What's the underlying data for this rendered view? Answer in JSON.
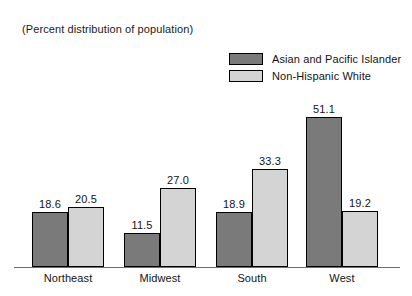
{
  "chart_data": {
    "type": "bar",
    "title": "(Percent distribution of population)",
    "subtitle": "",
    "xlabel": "",
    "ylabel": "",
    "grid": false,
    "legend_position": "top-right",
    "axis": {
      "visible_baseline": true,
      "y_ticks": [],
      "ylim": [
        0,
        55
      ]
    },
    "categories": [
      "Northeast",
      "Midwest",
      "South",
      "West"
    ],
    "series": [
      {
        "name": "Asian and Pacific Islander",
        "color": "#7a7a7a",
        "values": [
          18.6,
          11.5,
          18.9,
          51.1
        ],
        "labels": [
          "18.6",
          "11.5",
          "18.9",
          "51.1"
        ]
      },
      {
        "name": "Non-Hispanic White",
        "color": "#d4d4d4",
        "values": [
          20.5,
          27.0,
          33.3,
          19.2
        ],
        "labels": [
          "20.5",
          "27.0",
          "33.3",
          "19.2"
        ]
      }
    ]
  },
  "legend": {
    "entries": [
      {
        "label": "Asian and Pacific Islander",
        "color": "#7a7a7a"
      },
      {
        "label": "Non-Hispanic White",
        "color": "#d4d4d4"
      }
    ]
  },
  "colors": {
    "series_dark": "#7a7a7a",
    "series_light": "#d4d4d4",
    "outline": "#000000",
    "axis": "#6e6e6e",
    "text": "#141414",
    "background": "#ffffff"
  }
}
